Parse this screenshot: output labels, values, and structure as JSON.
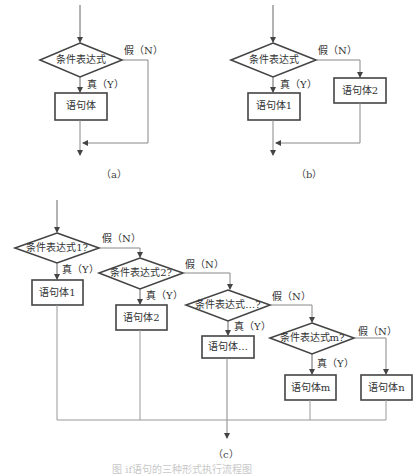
{
  "diagram_a": {
    "condition": "条件表达式",
    "false_label": "假（N）",
    "true_label": "真（Y）",
    "body": "语句体",
    "caption": "（a）"
  },
  "diagram_b": {
    "condition": "条件表达式",
    "false_label": "假（N）",
    "true_label": "真（Y）",
    "body_true": "语句体1",
    "body_false": "语句体2",
    "caption": "（b）"
  },
  "diagram_c": {
    "conditions": [
      "条件表达式1?",
      "条件表达式2?",
      "条件表达式…?",
      "条件表达式m?"
    ],
    "false_labels": [
      "假（N）",
      "假（N）",
      "假（N）",
      "假（N）"
    ],
    "true_labels": [
      "真（Y）",
      "真（Y）",
      "真（Y）",
      "真（Y）"
    ],
    "bodies": [
      "语句体1",
      "语句体2",
      "语句体…",
      "语句体m",
      "语句体n"
    ],
    "caption": "（c）"
  },
  "figure_caption": "图 if语句的三种形式执行流程图",
  "colors": {
    "stroke": "#555555",
    "box_stroke": "#444444",
    "line": "#8a8a8a",
    "text": "#333333",
    "background": "#ffffff"
  }
}
